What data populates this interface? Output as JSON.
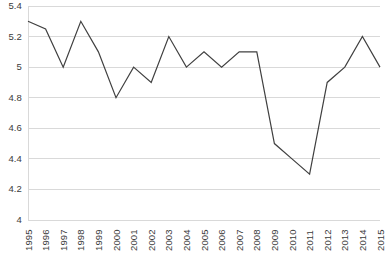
{
  "chart_data": {
    "type": "line",
    "title": "",
    "xlabel": "",
    "ylabel": "",
    "categories": [
      "1995",
      "1996",
      "1997",
      "1998",
      "1999",
      "2000",
      "2001",
      "2002",
      "2003",
      "2004",
      "2005",
      "2006",
      "2007",
      "2008",
      "2009",
      "2010",
      "2011",
      "2012",
      "2013",
      "2014",
      "2015"
    ],
    "values": [
      5.3,
      5.25,
      5.0,
      5.3,
      5.1,
      4.8,
      5.0,
      4.9,
      5.2,
      5.0,
      5.1,
      5.0,
      5.1,
      5.1,
      4.5,
      4.4,
      4.3,
      4.9,
      5.0,
      5.2,
      5.0
    ],
    "series": [
      {
        "name": "series-1",
        "values": [
          5.3,
          5.25,
          5.0,
          5.3,
          5.1,
          4.8,
          5.0,
          4.9,
          5.2,
          5.0,
          5.1,
          5.0,
          5.1,
          5.1,
          4.5,
          4.4,
          4.3,
          4.9,
          5.0,
          5.2,
          5.0
        ],
        "color": "#404040"
      }
    ],
    "ylim": [
      4,
      5.4
    ],
    "yticks": [
      4,
      4.2,
      4.4,
      4.6,
      4.8,
      5,
      5.2,
      5.4
    ],
    "ytick_labels": [
      "4",
      "4.2",
      "4.4",
      "4.6",
      "4.8",
      "5",
      "5.2",
      "5.4"
    ],
    "grid": true,
    "grid_color": "#d9d9d9",
    "legend": "none",
    "line_color": "#404040",
    "background": "#ffffff"
  }
}
